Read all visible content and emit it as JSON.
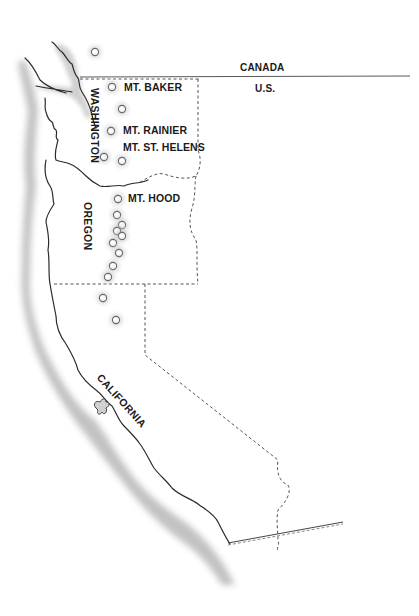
{
  "map": {
    "title": "Cascade Range volcanoes of the Pacific Northwest",
    "countries": {
      "north": "CANADA",
      "south": "U.S."
    },
    "states": [
      {
        "name": "WASHINGTON",
        "orientation": "vertical"
      },
      {
        "name": "OREGON",
        "orientation": "vertical"
      },
      {
        "name": "CALIFORNIA",
        "orientation": "diagonal"
      }
    ],
    "volcano_labels": [
      {
        "name": "MT. BAKER"
      },
      {
        "name": "MT. RAINIER"
      },
      {
        "name": "MT. ST. HELENS"
      },
      {
        "name": "MT. HOOD"
      }
    ],
    "volcano_markers": [
      {
        "x": 95,
        "y": 52
      },
      {
        "x": 112,
        "y": 87
      },
      {
        "x": 122,
        "y": 109
      },
      {
        "x": 111,
        "y": 131
      },
      {
        "x": 104,
        "y": 157
      },
      {
        "x": 122,
        "y": 161
      },
      {
        "x": 118,
        "y": 199
      },
      {
        "x": 117,
        "y": 215
      },
      {
        "x": 122,
        "y": 225
      },
      {
        "x": 117,
        "y": 231
      },
      {
        "x": 122,
        "y": 236
      },
      {
        "x": 113,
        "y": 243
      },
      {
        "x": 119,
        "y": 253
      },
      {
        "x": 113,
        "y": 266
      },
      {
        "x": 108,
        "y": 277
      },
      {
        "x": 103,
        "y": 298
      },
      {
        "x": 116,
        "y": 320
      }
    ],
    "colors": {
      "ink": "#1a1a1a",
      "coast_shade": "#bdbdbd",
      "border_dash": "#555555",
      "background": "#ffffff"
    }
  }
}
